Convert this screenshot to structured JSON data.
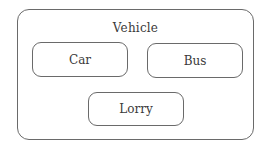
{
  "diagram": {
    "container": {
      "label": "Vehicle"
    },
    "children": [
      {
        "label": "Car"
      },
      {
        "label": "Bus"
      },
      {
        "label": "Lorry"
      }
    ]
  }
}
